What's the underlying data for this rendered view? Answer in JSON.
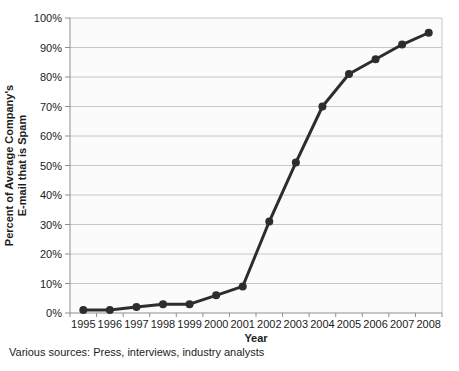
{
  "page": {
    "background": "#ffffff"
  },
  "footer": {
    "text": "Various sources: Press, interviews, industry analysts"
  },
  "chart_data": {
    "type": "line",
    "title": "",
    "xlabel": "Year",
    "ylabel": "Percent of Average Company's E-mail that is Spam",
    "ylabel_lines": [
      "Percent of Average Company's",
      "E-mail that is Spam"
    ],
    "categories": [
      "1995",
      "1996",
      "1997",
      "1998",
      "1999",
      "2000",
      "2001",
      "2002",
      "2003",
      "2004",
      "2005",
      "2006",
      "2007",
      "2008"
    ],
    "series": [
      {
        "name": "Percent of average company's e-mail that is spam",
        "values": [
          1,
          1,
          2,
          3,
          3,
          6,
          9,
          31,
          51,
          70,
          81,
          86,
          91,
          95
        ]
      }
    ],
    "y_tick_labels": [
      "0%",
      "10%",
      "20%",
      "30%",
      "40%",
      "50%",
      "60%",
      "70%",
      "80%",
      "90%",
      "100%"
    ],
    "ylim": [
      0,
      100
    ],
    "grid": true,
    "legend": "none",
    "colors": {
      "line": "#2d2d2d",
      "point": "#2d2d2d",
      "grid": "#c6c6c6",
      "axis": "#8f8f8f",
      "text": "#1c1c1c",
      "plot_bg": "#fbfbfb"
    }
  }
}
